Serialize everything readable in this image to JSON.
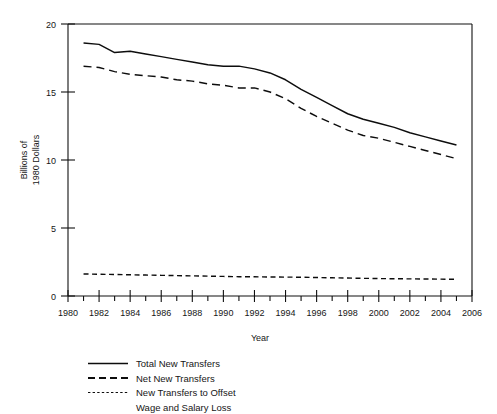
{
  "chart_data": {
    "type": "line",
    "title": "",
    "xlabel": "Year",
    "ylabel": "Billions of 1980 Dollars",
    "ylabel_lines": [
      "Billions of",
      "1980 Dollars"
    ],
    "xlim": [
      1980,
      2006
    ],
    "ylim": [
      0,
      20
    ],
    "xticks": [
      1980,
      1982,
      1984,
      1986,
      1988,
      1990,
      1992,
      1994,
      1996,
      1998,
      2000,
      2002,
      2004,
      2006
    ],
    "xtick_labels": [
      "1980",
      "1982",
      "1984",
      "1986",
      "1988",
      "1990",
      "1992",
      "1994",
      "1996",
      "1998",
      "2000",
      "2002",
      "2004",
      "2006"
    ],
    "xminorticks": [
      1981,
      1983,
      1985,
      1987,
      1989,
      1991,
      1993,
      1995,
      1997,
      1999,
      2001,
      2003,
      2005
    ],
    "yticks": [
      0,
      5,
      10,
      15,
      20
    ],
    "ytick_labels": [
      "0",
      "5",
      "10",
      "15",
      "20"
    ],
    "grid": false,
    "legend_position": "below-left",
    "x": [
      1981,
      1982,
      1983,
      1984,
      1985,
      1986,
      1987,
      1988,
      1989,
      1990,
      1991,
      1992,
      1993,
      1994,
      1995,
      1996,
      1997,
      1998,
      1999,
      2000,
      2001,
      2002,
      2003,
      2004,
      2005
    ],
    "series": [
      {
        "name": "Total New Transfers",
        "style": "solid",
        "values": [
          18.6,
          18.5,
          17.9,
          18.0,
          17.8,
          17.6,
          17.4,
          17.2,
          17.0,
          16.9,
          16.9,
          16.7,
          16.4,
          15.9,
          15.2,
          14.6,
          14.0,
          13.4,
          13.0,
          12.7,
          12.4,
          12.0,
          11.7,
          11.4,
          11.1
        ]
      },
      {
        "name": "Net New Transfers",
        "style": "dashed",
        "values": [
          16.9,
          16.8,
          16.5,
          16.3,
          16.2,
          16.1,
          15.9,
          15.8,
          15.6,
          15.5,
          15.3,
          15.3,
          15.0,
          14.5,
          13.8,
          13.2,
          12.7,
          12.2,
          11.8,
          11.6,
          11.3,
          11.0,
          10.7,
          10.4,
          10.1
        ]
      },
      {
        "name": "New Transfers to Offset Wage and Salary Loss",
        "style": "dotted",
        "values": [
          1.62,
          1.6,
          1.58,
          1.56,
          1.54,
          1.52,
          1.5,
          1.48,
          1.46,
          1.44,
          1.42,
          1.41,
          1.4,
          1.39,
          1.38,
          1.36,
          1.34,
          1.32,
          1.3,
          1.28,
          1.27,
          1.26,
          1.25,
          1.24,
          1.23
        ]
      }
    ]
  },
  "legend": {
    "entries": [
      {
        "label": "Total New Transfers",
        "style": "solid"
      },
      {
        "label": "Net New Transfers",
        "style": "dashed"
      },
      {
        "label": "New Transfers to Offset",
        "style": "dotted"
      },
      {
        "label": "Wage and Salary  Loss",
        "style": "none"
      }
    ]
  },
  "colors": {
    "ink": "#0d0d0d",
    "background": "#ffffff"
  }
}
